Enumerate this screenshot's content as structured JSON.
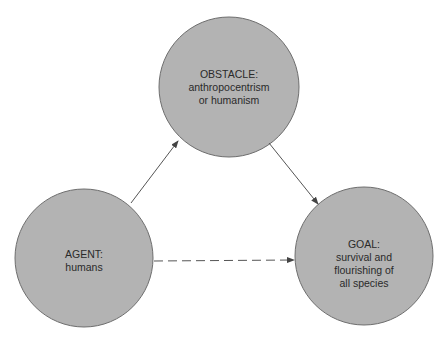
{
  "diagram": {
    "colors": {
      "node_fill": "#b3b3b3",
      "node_stroke": "#6e6e6e",
      "arrow": "#555555",
      "background": "#ffffff"
    },
    "nodes": [
      {
        "id": "obstacle",
        "title": "OBSTACLE:",
        "lines": [
          "anthropocentrism",
          "or humanism"
        ],
        "cx": 229,
        "cy": 87,
        "r": 70
      },
      {
        "id": "agent",
        "title": "AGENT:",
        "lines": [
          "humans"
        ],
        "cx": 84,
        "cy": 258,
        "r": 69
      },
      {
        "id": "goal",
        "title": "GOAL:",
        "lines": [
          "survival and",
          "flourishing of",
          "all species"
        ],
        "cx": 364,
        "cy": 256,
        "r": 69
      }
    ],
    "edges": [
      {
        "from": "agent",
        "to": "obstacle",
        "style": "solid"
      },
      {
        "from": "obstacle",
        "to": "goal",
        "style": "solid"
      },
      {
        "from": "agent",
        "to": "goal",
        "style": "dashed"
      }
    ]
  }
}
